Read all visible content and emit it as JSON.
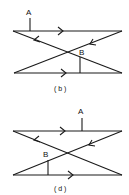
{
  "panels": [
    {
      "id": "b",
      "caption": "( b )",
      "point_a_label": "A",
      "point_b_label": "B"
    },
    {
      "id": "d",
      "caption": "( d )",
      "point_a_label": "A",
      "point_b_label": "B"
    }
  ],
  "colors": {
    "stroke": "#1a1a1a",
    "background": "#ffffff"
  }
}
